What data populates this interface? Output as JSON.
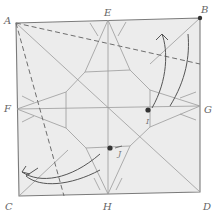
{
  "diagram": {
    "type": "origami-crease-pattern",
    "paper_color": "#ececec",
    "line_color": "#8a8a8a",
    "edge_color": "#7a7a7a",
    "corner_labels": {
      "A": "A",
      "B": "B",
      "C": "C",
      "D": "D"
    },
    "edge_midpoint_labels": {
      "E": "E",
      "F": "F",
      "G": "G",
      "H": "H"
    },
    "reference_points": {
      "I": "I",
      "J": "J"
    },
    "fold_lines": [
      {
        "from": "A",
        "to": "dashed-right",
        "style": "valley-dashed"
      },
      {
        "from": "A",
        "to": "dashed-bottom",
        "style": "valley-dashed"
      }
    ],
    "arrows": [
      {
        "name": "fold-arrow-upper-right",
        "direction": "up"
      },
      {
        "name": "fold-arrow-lower-left",
        "direction": "left"
      }
    ]
  }
}
